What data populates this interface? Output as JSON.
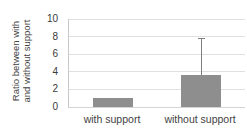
{
  "chart_data": {
    "type": "bar",
    "title": "",
    "xlabel": "",
    "ylabel": "Ratio between with and without support",
    "ylabel_lines": [
      "Ratio between with",
      "and without support"
    ],
    "categories": [
      "with support",
      "without support"
    ],
    "values": [
      1.0,
      3.6
    ],
    "error_plus": [
      0,
      4.2
    ],
    "yticks": [
      0,
      2,
      4,
      6,
      8,
      10
    ],
    "ylim": [
      0,
      10
    ],
    "grid": true,
    "legend": "none",
    "bar_color": "#8e8e8e",
    "error_color": "#7f7f7f",
    "grid_color": "#e0e0e0",
    "axis_color": "#c9c9c9",
    "text_color": "#3f3f3f"
  }
}
